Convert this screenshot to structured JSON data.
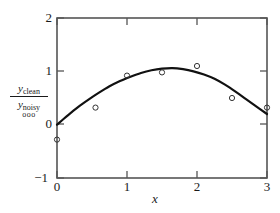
{
  "chart_data": {
    "type": "line",
    "title": "",
    "subtitle": "",
    "xlabel": "x",
    "ylabel": "y_clean / y_noisy",
    "xlim": [
      0,
      3
    ],
    "ylim": [
      -1,
      2
    ],
    "grid": false,
    "legend_position": "left-outside",
    "x_ticks": [
      "0",
      "1",
      "2",
      "3"
    ],
    "x_tick_values": [
      0,
      1,
      2,
      3
    ],
    "y_ticks": [
      "−1",
      "0",
      "1",
      "2"
    ],
    "y_tick_values": [
      -1,
      0,
      1,
      2
    ],
    "series": [
      {
        "name": "y_clean",
        "style": "solid-line",
        "color": "#111111",
        "x": [
          0,
          0.15,
          0.3,
          0.45,
          0.6,
          0.75,
          0.9,
          1.05,
          1.2,
          1.35,
          1.5,
          1.65,
          1.8,
          1.95,
          2.1,
          2.25,
          2.4,
          2.55,
          2.7,
          2.85,
          3
        ],
        "values": [
          0.0,
          0.17,
          0.33,
          0.47,
          0.6,
          0.72,
          0.82,
          0.9,
          0.97,
          1.02,
          1.05,
          1.06,
          1.04,
          1.0,
          0.94,
          0.86,
          0.75,
          0.62,
          0.48,
          0.34,
          0.2
        ]
      },
      {
        "name": "y_noisy",
        "style": "open-circle-markers",
        "color": "#111111",
        "x": [
          0,
          0.55,
          1.0,
          1.5,
          2.0,
          2.5,
          3.0
        ],
        "values": [
          -0.28,
          0.32,
          0.92,
          0.98,
          1.1,
          0.5,
          0.32
        ]
      }
    ],
    "annotations": []
  },
  "legend": {
    "numerator_var": "y",
    "numerator_sub": "clean",
    "denominator_var": "y",
    "denominator_sub": "noisy",
    "marker_sample": "ooo"
  },
  "axis": {
    "x_label": "x"
  },
  "colors": {
    "line": "#111111",
    "marker_stroke": "#333333",
    "frame": "#555555",
    "text": "#1a1a1a",
    "background": "#ffffff"
  }
}
